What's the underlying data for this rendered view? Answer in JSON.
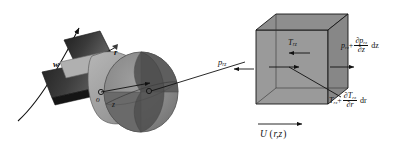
{
  "figure": {
    "name": "impeller-control-volume-diagram",
    "background_color": "#ffffff",
    "width": 407,
    "height": 148
  },
  "colors": {
    "line": "#111111",
    "cube_face_front": "#9a9a9a",
    "cube_face_top": "#8e8e8e",
    "cube_face_side": "#8a8a8a",
    "hub_light": "#a8a8a8",
    "hub_mid": "#8f8f8f",
    "disc_dark": "#595959",
    "blade_dark": "#2e2e2e",
    "blade_mid": "#4a4a4a"
  },
  "left_diagram": {
    "name": "impeller",
    "labels": {
      "angular_velocity": "w",
      "radius": "r",
      "origin": "o",
      "axial": "z"
    }
  },
  "right_diagram": {
    "name": "control-volume-cube",
    "labels": {
      "pressure_left": {
        "symbol": "p",
        "subscript": "rz"
      },
      "pressure_right": {
        "symbol": "p",
        "subscript": "rz",
        "plus": "+",
        "derivative_numerator_partial": "∂",
        "derivative_numerator_symbol": "p",
        "derivative_numerator_subscript": "rz",
        "derivative_denominator_partial": "∂",
        "derivative_denominator_var": "z",
        "differential": "dz"
      },
      "stress_inner": {
        "symbol": "T",
        "subscript": "rz"
      },
      "stress_outer": {
        "symbol": "T",
        "subscript": "rz",
        "plus": "+",
        "derivative_numerator_partial": "∂",
        "derivative_numerator_symbol": "T",
        "derivative_numerator_subscript": "rz",
        "derivative_denominator_partial": "∂",
        "derivative_denominator_var": "r",
        "differential": "dr"
      },
      "velocity": {
        "symbol": "U",
        "open_paren": "(",
        "args": "r,z",
        "close_paren": ")"
      }
    }
  }
}
